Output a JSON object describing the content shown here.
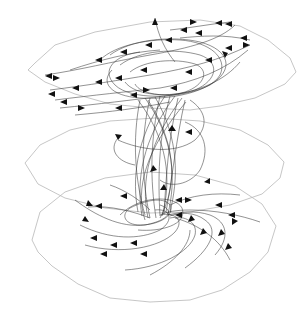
{
  "figure": {
    "colors": {
      "background": "#ffffff",
      "plane_outline": "#b8b8b8",
      "streamline": "#2a2a2a",
      "arrowhead": "#111111"
    },
    "planes": [
      {
        "name": "top-slice",
        "cx": 155,
        "cy": 70,
        "rx": 140,
        "ry": 48
      },
      {
        "name": "middle-slice",
        "cx": 155,
        "cy": 163,
        "rx": 130,
        "ry": 45
      },
      {
        "name": "bottom-slice",
        "cx": 155,
        "cy": 232,
        "rx": 125,
        "ry": 68
      }
    ],
    "funnel": {
      "top_cx": 165,
      "top_cy": 95,
      "bottom_cx": 150,
      "bottom_cy": 218,
      "top_width": 60,
      "waist_width": 30
    }
  }
}
